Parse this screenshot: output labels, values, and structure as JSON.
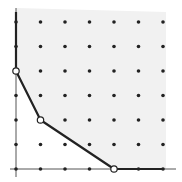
{
  "diagram": {
    "type": "newton-polygon",
    "grid": {
      "cols": 7,
      "rows": 7,
      "x_range": [
        0,
        6
      ],
      "y_range": [
        0,
        6
      ]
    },
    "polygon_vertices": [
      [
        0,
        4
      ],
      [
        1,
        2
      ],
      [
        4,
        0
      ]
    ],
    "shaded_region": "above-and-right of polygon",
    "colors": {
      "background": "#ffffff",
      "shade": "#f1f1f1",
      "axis": "#555555",
      "polygon": "#222222",
      "dot": "#222222",
      "vertex_fill": "#ffffff"
    }
  }
}
